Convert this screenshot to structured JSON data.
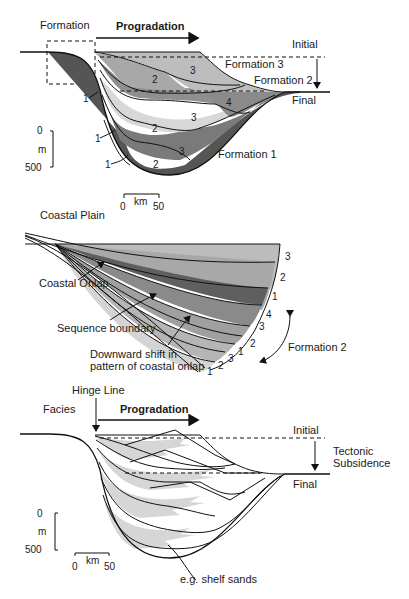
{
  "panels": {
    "formation": {
      "title": "Formation",
      "arrow_label": "Progradation",
      "labels": {
        "initial": "Initial",
        "final": "Final",
        "formation3": "Formation 3",
        "formation2": "Formation 2",
        "formation1": "Formation 1"
      },
      "layer_numbers": [
        "3",
        "2",
        "4",
        "3",
        "2",
        "3",
        "2",
        "1",
        "1",
        "1"
      ],
      "scale": {
        "depth_top": "0",
        "depth_unit": "m",
        "depth_bottom": "500",
        "dist_left": "0",
        "dist_unit": "km",
        "dist_right": "50"
      },
      "colors": {
        "light": "#bdbdbd",
        "pale": "#dcdcdc",
        "mid": "#9a9a9a",
        "dark": "#6e6e6e",
        "darker": "#555555"
      }
    },
    "coastal_plain": {
      "title": "Coastal Plain",
      "annotations": {
        "coastal_onlap": "Coastal Onlap",
        "sequence_boundary": "Sequence boundary",
        "downward_shift_1": "Downward shift in",
        "downward_shift_2": "pattern of coastal onlap",
        "formation2": "Formation 2"
      },
      "layer_numbers": [
        "3",
        "2",
        "1",
        "4",
        "3",
        "2",
        "1",
        "3",
        "2",
        "1"
      ]
    },
    "facies": {
      "title": "Facies",
      "hinge_label": "Hinge Line",
      "arrow_label": "Progradation",
      "labels": {
        "initial": "Initial",
        "final": "Final",
        "tectonic_1": "Tectonic",
        "tectonic_2": "Subsidence",
        "shelf_sands": "e.g. shelf sands"
      },
      "scale": {
        "depth_top": "0",
        "depth_unit": "m",
        "depth_bottom": "500",
        "dist_left": "0",
        "dist_unit": "km",
        "dist_right": "50"
      },
      "colors": {
        "sand": "#d6d6d6"
      }
    }
  }
}
